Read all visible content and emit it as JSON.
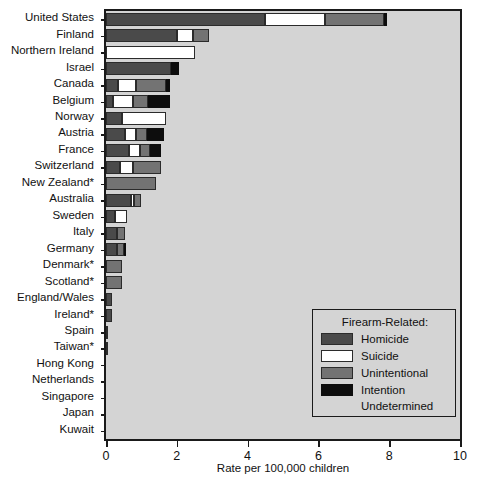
{
  "chart_data": {
    "type": "bar",
    "orientation": "horizontal",
    "stacked": true,
    "title": "",
    "xlabel": "Rate per 100,000 children",
    "ylabel": "",
    "xlim": [
      0,
      10
    ],
    "xticks": [
      0,
      2,
      4,
      6,
      8,
      10
    ],
    "grid": false,
    "legend_position": "inside-lower-right",
    "legend_title": "Firearm-Related:",
    "series": [
      {
        "name": "Homicide",
        "color": "#4a4a4a",
        "values": [
          4.5,
          2.0,
          0.0,
          1.85,
          0.35,
          0.2,
          0.45,
          0.55,
          0.65,
          0.4,
          0.0,
          0.7,
          0.25,
          0.3,
          0.3,
          0.0,
          0.0,
          0.18,
          0.18,
          0.05,
          0.05,
          0.0,
          0.0,
          0.0,
          0.0,
          0.0
        ]
      },
      {
        "name": "Suicide",
        "color": "#ffffff",
        "values": [
          1.7,
          0.45,
          2.5,
          0.0,
          0.5,
          0.55,
          1.25,
          0.3,
          0.3,
          0.35,
          0.0,
          0.08,
          0.35,
          0.0,
          0.0,
          0.0,
          0.0,
          0.0,
          0.0,
          0.0,
          0.0,
          0.0,
          0.0,
          0.0,
          0.0,
          0.0
        ]
      },
      {
        "name": "Unintentional",
        "color": "#737373",
        "values": [
          1.65,
          0.45,
          0.0,
          0.0,
          0.85,
          0.45,
          0.0,
          0.3,
          0.3,
          0.8,
          1.4,
          0.2,
          0.0,
          0.25,
          0.2,
          0.45,
          0.45,
          0.0,
          0.0,
          0.0,
          0.0,
          0.0,
          0.0,
          0.0,
          0.0,
          0.0
        ]
      },
      {
        "name": "Intention Undetermined",
        "color": "#0d0d0d",
        "values": [
          0.1,
          0.0,
          0.0,
          0.2,
          0.1,
          0.6,
          0.0,
          0.5,
          0.3,
          0.0,
          0.0,
          0.0,
          0.0,
          0.0,
          0.05,
          0.0,
          0.0,
          0.0,
          0.0,
          0.0,
          0.0,
          0.0,
          0.0,
          0.0,
          0.0,
          0.0
        ]
      }
    ],
    "categories": [
      "United States",
      "Finland",
      "Northern Ireland",
      "Israel",
      "Canada",
      "Belgium",
      "Norway",
      "Austria",
      "France",
      "Switzerland",
      "New Zealand*",
      "Australia",
      "Sweden",
      "Italy",
      "Germany",
      "Denmark*",
      "Scotland*",
      "England/Wales",
      "Ireland*",
      "Spain",
      "Taiwan*",
      "Hong Kong",
      "Netherlands",
      "Singapore",
      "Japan",
      "Kuwait"
    ],
    "totals": [
      7.95,
      2.9,
      2.5,
      2.05,
      1.8,
      1.8,
      1.7,
      1.65,
      1.55,
      1.55,
      1.4,
      0.98,
      0.6,
      0.55,
      0.55,
      0.45,
      0.45,
      0.18,
      0.18,
      0.05,
      0.05,
      0.0,
      0.0,
      0.0,
      0.0,
      0.0
    ]
  },
  "legend": {
    "title": "Firearm-Related:",
    "items": [
      {
        "label": "Homicide",
        "swatch": "homicide"
      },
      {
        "label": "Suicide",
        "swatch": "suicide"
      },
      {
        "label": "Unintentional",
        "swatch": "unintentional"
      },
      {
        "label": "Intention",
        "swatch": "undetermined"
      }
    ],
    "continuation": "Undetermined"
  },
  "axis": {
    "x_title": "Rate per 100,000 children",
    "x_tick_labels": [
      "0",
      "2",
      "4",
      "6",
      "8",
      "10"
    ]
  }
}
